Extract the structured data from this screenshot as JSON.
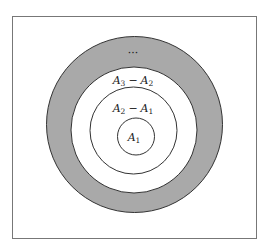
{
  "figure": {
    "type": "nested-sets-diagram",
    "frame_color": "#777777",
    "shaded_color": "#a9a9a9",
    "stroke_color": "#333333",
    "regions": [
      {
        "name": "A1",
        "label_main": "A",
        "label_sub": "1"
      },
      {
        "name": "A2 - A1",
        "label_main_1": "A",
        "label_sub_1": "2",
        "operator": "−",
        "label_main_2": "A",
        "label_sub_2": "1"
      },
      {
        "name": "A3 - A2",
        "label_main_1": "A",
        "label_sub_1": "3",
        "operator": "−",
        "label_main_2": "A",
        "label_sub_2": "2"
      },
      {
        "name": "continuation",
        "label": "···"
      }
    ]
  }
}
